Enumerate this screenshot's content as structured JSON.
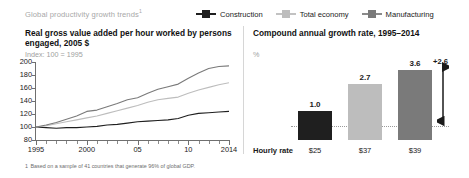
{
  "header": {
    "kicker": "Global productivity growth trends",
    "kicker_footnote_marker": "1"
  },
  "legend": {
    "items": [
      {
        "label": "Construction",
        "color": "#1f1f1f"
      },
      {
        "label": "Total economy",
        "color": "#bdbdbd"
      },
      {
        "label": "Manufacturing",
        "color": "#7a7a7a"
      }
    ]
  },
  "left_panel": {
    "title": "Real gross value added per hour worked by persons engaged, 2005 $",
    "subtitle": "Index: 100 = 1995"
  },
  "right_panel": {
    "title": "Compound annual growth rate, 1995–2014",
    "subtitle": "%",
    "hourly_rate_label": "Hourly rate",
    "delta_label": "+2.6"
  },
  "footnote": {
    "marker": "1",
    "text": "Based on a sample of 41 countries that generate 96% of global GDP."
  },
  "chart_data": [
    {
      "type": "line",
      "title": "Real gross value added per hour worked by persons engaged, 2005 $",
      "subtitle": "Index: 100 = 1995",
      "xlabel": "",
      "ylabel": "",
      "xlim": [
        1995,
        2014
      ],
      "ylim": [
        80,
        200
      ],
      "yticks": [
        80,
        100,
        120,
        140,
        160,
        180,
        200
      ],
      "xticks": [
        1995,
        2000,
        2005,
        2010,
        2014
      ],
      "xtick_labels": [
        "1995",
        "2000",
        "05",
        "10",
        "2014"
      ],
      "grid": false,
      "legend_position": "top-right",
      "x": [
        1995,
        1996,
        1997,
        1998,
        1999,
        2000,
        2001,
        2002,
        2003,
        2004,
        2005,
        2006,
        2007,
        2008,
        2009,
        2010,
        2011,
        2012,
        2013,
        2014
      ],
      "series": [
        {
          "name": "Construction",
          "color": "#1f1f1f",
          "values": [
            100,
            99,
            98,
            99,
            99,
            100,
            101,
            103,
            104,
            106,
            108,
            109,
            110,
            111,
            113,
            118,
            121,
            122,
            123,
            124
          ]
        },
        {
          "name": "Total economy",
          "color": "#bdbdbd",
          "values": [
            100,
            102,
            105,
            108,
            111,
            114,
            117,
            121,
            125,
            129,
            133,
            138,
            142,
            144,
            146,
            152,
            157,
            161,
            165,
            168
          ]
        },
        {
          "name": "Manufacturing",
          "color": "#7a7a7a",
          "values": [
            100,
            103,
            107,
            112,
            117,
            124,
            126,
            131,
            136,
            142,
            145,
            152,
            158,
            162,
            166,
            175,
            183,
            190,
            193,
            194
          ]
        }
      ]
    },
    {
      "type": "bar",
      "title": "Compound annual growth rate, 1995–2014",
      "subtitle": "%",
      "xlabel": "",
      "ylabel": "%",
      "categories": [
        "Construction",
        "Total economy",
        "Manufacturing"
      ],
      "values": [
        1.0,
        2.7,
        3.6
      ],
      "value_labels": [
        "1.0",
        "2.7",
        "3.6"
      ],
      "colors": [
        "#1f1f1f",
        "#bdbdbd",
        "#7a7a7a"
      ],
      "ylim": [
        0,
        4.0
      ],
      "grid": false,
      "annotations": [
        {
          "text": "+2.6",
          "type": "delta-arrow",
          "from": 1.0,
          "to": 3.6
        }
      ],
      "secondary_row": {
        "label": "Hourly rate",
        "values": [
          "$25",
          "$37",
          "$39"
        ]
      }
    }
  ]
}
